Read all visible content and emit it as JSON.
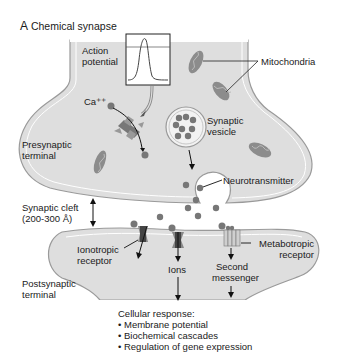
{
  "title": {
    "letter": "A",
    "text": "Chemical synapse"
  },
  "labels": {
    "action_potential": [
      "Action",
      "potential"
    ],
    "mitochondria": "Mitochondria",
    "calcium": "Ca⁺⁺",
    "synaptic_vesicle": [
      "Synaptic",
      "vesicle"
    ],
    "presynaptic_terminal": [
      "Presynaptic",
      "terminal"
    ],
    "neurotransmitter": "Neurotransmitter",
    "synaptic_cleft": [
      "Synaptic cleft",
      "(200-300 Å)"
    ],
    "ionotropic_receptor": [
      "Ionotropic",
      "receptor"
    ],
    "ions": "Ions",
    "second_messenger": [
      "Second",
      "messenger"
    ],
    "metabotropic_receptor": [
      "Metabotropic",
      "receptor"
    ],
    "postsynaptic_terminal": [
      "Postsynaptic",
      "terminal"
    ]
  },
  "cellular_response": {
    "heading": "Cellular response:",
    "items": [
      "Membrane potential",
      "Biochemical cascades",
      "Regulation of gene expression"
    ]
  },
  "colors": {
    "cell_fill": "#dcdcdc",
    "cell_outline": "#8a8a8a",
    "organelle": "#8c8c8c",
    "text": "#1a1a1a"
  }
}
